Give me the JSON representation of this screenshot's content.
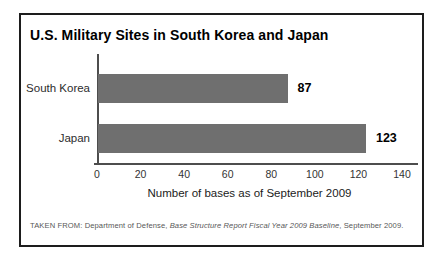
{
  "title": "U.S. Military Sites in South Korea and Japan",
  "chart_data": {
    "type": "bar",
    "orientation": "horizontal",
    "title": "U.S. Military Sites in South Korea and Japan",
    "categories": [
      "South Korea",
      "Japan"
    ],
    "values": [
      87,
      123
    ],
    "value_labels": [
      "87",
      "123"
    ],
    "xlabel": "Number of bases as of September 2009",
    "ylabel": "",
    "xlim": [
      0,
      140
    ],
    "xticks": [
      0,
      20,
      40,
      60,
      80,
      100,
      120,
      140
    ],
    "grid": false,
    "legend": false,
    "bar_color": "#6f6f6f"
  },
  "source_note": {
    "prefix": "TAKEN FROM: Department of Defense, ",
    "italic": "Base Structure Report Fiscal Year 2009 Baseline",
    "suffix": ", September 2009."
  },
  "colors": {
    "bar": "#6f6f6f",
    "axis": "#4d4d4d",
    "frame_border": "#1d1d1d",
    "background": "#ffffff",
    "text": "#000000",
    "muted_text": "#575757"
  }
}
